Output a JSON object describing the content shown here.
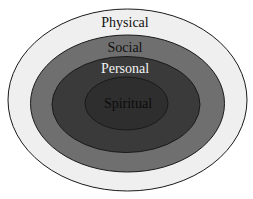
{
  "diagram": {
    "type": "nested-ellipses",
    "layers": [
      {
        "label": "Physical",
        "fill": "#efefef",
        "text_color": "#111111"
      },
      {
        "label": "Social",
        "fill": "#6f6f6f",
        "text_color": "#111111"
      },
      {
        "label": "Personal",
        "fill": "#3a3a3a",
        "text_color": "#f2f2f2"
      },
      {
        "label": "Spiritual",
        "fill": "#2e2e2e",
        "text_color": "#0c0c0c"
      }
    ],
    "stroke_color": "#1a1a1a"
  }
}
